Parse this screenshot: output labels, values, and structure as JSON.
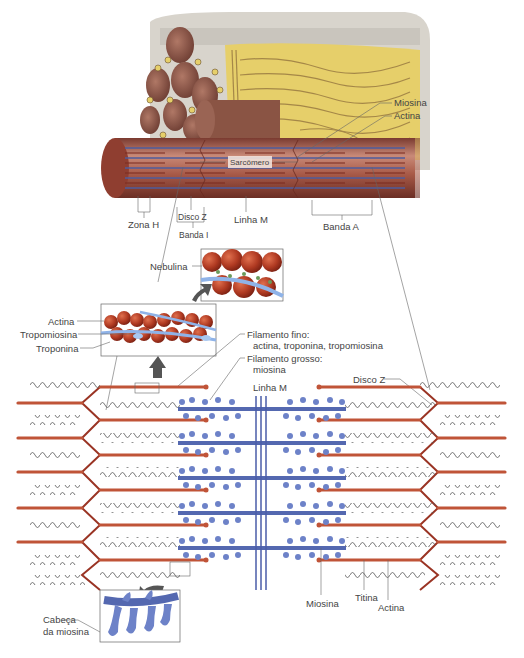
{
  "diagram": {
    "type": "anatomical illustration",
    "colors": {
      "actin": "#b5452c",
      "myosin": "#5468b0",
      "titin": "#555555",
      "z_disc": "#9a3424",
      "connective_tissue": "#e8d47a",
      "myofibril": "#8b4a3c"
    }
  },
  "labels": {
    "myofibril_top": {
      "miosina": "Miosina",
      "actina": "Actina",
      "sarcomero": "Sarcômero",
      "zona_h": "Zona H",
      "disco_z": "Disco Z",
      "banda_i": "Banda I",
      "linha_m": "Linha M",
      "banda_a": "Banda A"
    },
    "thin_filament_zoom": {
      "nebulina": "Nebulina",
      "actina": "Actina",
      "tropomiosina": "Tropomiosina",
      "troponina": "Troponina"
    },
    "sarcomere_detail": {
      "filamento_fino_1": "Filamento fino:",
      "filamento_fino_2": "actina, troponina, tropomiosina",
      "filamento_grosso_1": "Filamento grosso:",
      "filamento_grosso_2": "miosina",
      "linha_m": "Linha M",
      "disco_z": "Disco Z",
      "miosina": "Miosina",
      "titina": "Titina",
      "actina": "Actina"
    },
    "myosin_head_zoom": {
      "cabeca_1": "Cabeça",
      "cabeca_2": "da miosina"
    }
  }
}
